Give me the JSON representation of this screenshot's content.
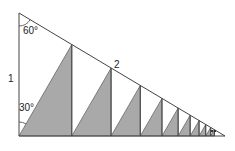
{
  "figure": {
    "colors": {
      "line": "#444444",
      "shade": "#a9a9a9",
      "background": "#ffffff"
    },
    "labels": {
      "top_angle": "60°",
      "bottom_angle": "30°",
      "left_side": "1",
      "hypotenuse": "2"
    },
    "geometry": {
      "apex": [
        19,
        13
      ],
      "bottom_left": [
        19,
        136
      ],
      "bottom_right": [
        225,
        136
      ],
      "ratio": 0.75,
      "steps": 10
    }
  }
}
